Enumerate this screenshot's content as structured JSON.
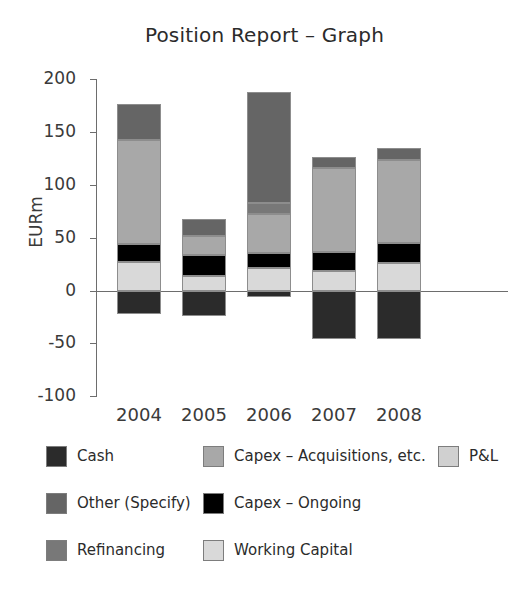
{
  "chart_data": {
    "type": "bar",
    "stacked": true,
    "title": "Position Report – Graph",
    "xlabel": "",
    "ylabel": "EURm",
    "ylim": [
      -100,
      200
    ],
    "yticks": [
      "200",
      "150",
      "100",
      "50",
      "0",
      "-50",
      "-100"
    ],
    "ytick_values": [
      200,
      150,
      100,
      50,
      0,
      -50,
      -100
    ],
    "grid": false,
    "legend_position": "bottom",
    "categories": [
      "2004",
      "2005",
      "2006",
      "2007",
      "2008"
    ],
    "series": [
      {
        "name": "Cash",
        "color": "#2b2b2b",
        "values": [
          -22,
          -24,
          -6,
          -45,
          -45
        ]
      },
      {
        "name": "Working Capital",
        "color": "#d9d9d9",
        "values": [
          27,
          14,
          22,
          19,
          26
        ]
      },
      {
        "name": "Capex – Ongoing",
        "color": "#000000",
        "values": [
          17,
          20,
          14,
          18,
          19
        ]
      },
      {
        "name": "Capex – Acquisitions, etc.",
        "color": "#a8a8a8",
        "values": [
          98,
          18,
          37,
          79,
          79
        ]
      },
      {
        "name": "Refinancing",
        "color": "#787878",
        "values": [
          0,
          0,
          10,
          0,
          0
        ]
      },
      {
        "name": "Other (Specify)",
        "color": "#656565",
        "values": [
          34,
          16,
          105,
          10,
          11
        ]
      }
    ],
    "positive_totals": [
      176,
      68,
      188,
      126,
      135
    ],
    "negative_totals": [
      -22,
      -24,
      -6,
      -45,
      -45
    ]
  },
  "legend": {
    "entries": [
      {
        "label": "Cash",
        "color": "#2b2b2b",
        "icon": "legend-swatch-cash"
      },
      {
        "label": "Capex – Acquisitions, etc.",
        "color": "#a8a8a8",
        "icon": "legend-swatch-capex-acquisitions"
      },
      {
        "label": "P&L",
        "color": "#d0d0d0",
        "icon": "legend-swatch-pl"
      },
      {
        "label": "Other (Specify)",
        "color": "#656565",
        "icon": "legend-swatch-other"
      },
      {
        "label": "Capex – Ongoing",
        "color": "#000000",
        "icon": "legend-swatch-capex-ongoing"
      },
      {
        "label": "Working Capital",
        "color": "#d9d9d9",
        "icon": "legend-swatch-working-capital"
      },
      {
        "label": "Refinancing",
        "color": "#787878",
        "icon": "legend-swatch-refinancing"
      }
    ]
  },
  "axis": {
    "ylabel": "EURm",
    "ytick_labels": [
      "200",
      "150",
      "100",
      "50",
      "0",
      "-50",
      "-100"
    ],
    "xtick_labels": [
      "2004",
      "2005",
      "2006",
      "2007",
      "2008"
    ]
  },
  "colors": {
    "cash": "#2b2b2b",
    "other": "#656565",
    "refinancing": "#787878",
    "capex_acquisitions": "#a8a8a8",
    "capex_ongoing": "#000000",
    "working_capital": "#d9d9d9",
    "pl": "#d0d0d0",
    "axis": "#6d6d6d",
    "text": "#2b2b2b",
    "background": "#ffffff"
  }
}
